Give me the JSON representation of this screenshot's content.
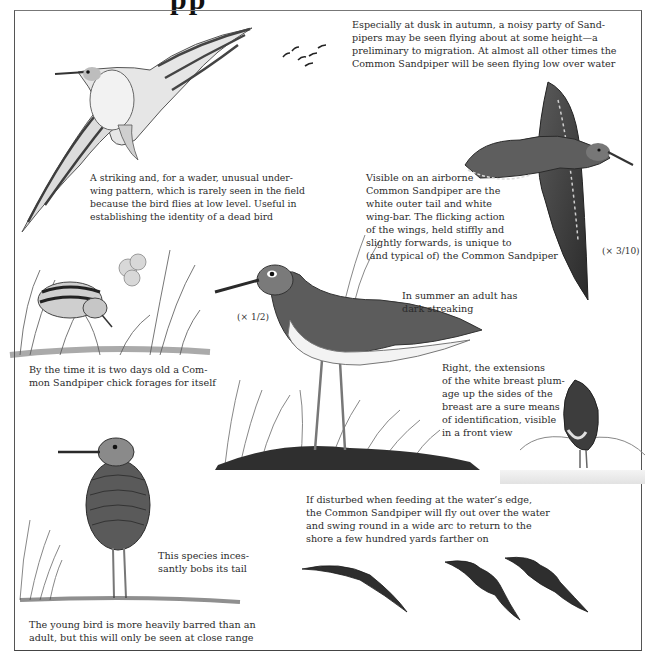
{
  "page": {
    "title_fragment": "pp",
    "subject": "Common Sandpiper"
  },
  "captions": {
    "migration": {
      "lines": [
        "Especially at dusk in autumn, a noisy party of Sand-",
        "pipers may be seen flying about at some height—a",
        "preliminary to migration. At almost all other times the",
        "Common Sandpiper will be seen flying low over water"
      ]
    },
    "underwing": {
      "lines": [
        "A striking and, for a wader, unusual under-",
        "wing pattern, which is rarely seen in the field",
        "because the bird flies at low level. Useful in",
        "establishing the identity of a dead bird"
      ]
    },
    "airborne": {
      "lines": [
        "Visible on an airborne",
        "Common Sandpiper are the",
        "white outer tail and white",
        "wing-bar. The flicking action",
        "of the wings, held stiffly and",
        "slightly forwards, is unique to",
        "(and typical of) the Common Sandpiper"
      ]
    },
    "summer_adult": {
      "lines": [
        "In summer an adult has",
        "dark streaking"
      ]
    },
    "chick": {
      "lines": [
        "By the time it is two days old a Com-",
        "mon Sandpiper chick forages for itself"
      ]
    },
    "front_view": {
      "lines": [
        "Right, the extensions",
        "of the white breast plum-",
        "age up the sides of the",
        "breast are a sure means",
        "of identification, visible",
        "in a front view"
      ]
    },
    "disturbed": {
      "lines": [
        "If disturbed when feeding at the water’s edge,",
        "the Common Sandpiper will fly out over the water",
        "and swing round in a wide arc to return to the",
        "shore a few hundred yards farther on"
      ]
    },
    "bobs_tail": {
      "lines": [
        "This species inces-",
        "santly bobs its tail"
      ]
    },
    "young_bird": {
      "lines": [
        "The young bird is more heavily barred than an",
        "adult, but this will only be seen at close range"
      ]
    }
  },
  "scales": {
    "flying_bird": "(× 3/10)",
    "standing_adult": "(× 1/2)"
  },
  "colors": {
    "text": "#2b2b2b",
    "frame": "#555555",
    "bird_dark": "#3a3a3a",
    "bird_mid": "#6e6e6e",
    "bird_light": "#d8d8d8",
    "paper": "#ffffff"
  }
}
